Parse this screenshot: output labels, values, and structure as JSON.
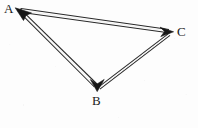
{
  "figure": {
    "name": "triangle-vector-diagram",
    "type": "geometry-diagram",
    "background_color": "#fdfdfd",
    "stroke_color": "#2a2a2a",
    "label_color": "#1a1a1a",
    "width": 198,
    "height": 128
  },
  "labels": {
    "a": "A",
    "b": "B",
    "c": "C"
  },
  "vertices": [
    {
      "id": "A",
      "label": "A",
      "x": 16,
      "y": 9,
      "label_x": 4,
      "label_y": 2
    },
    {
      "id": "B",
      "label": "B",
      "x": 97,
      "y": 90,
      "label_x": 92,
      "label_y": 94
    },
    {
      "id": "C",
      "label": "C",
      "x": 172,
      "y": 32,
      "label_x": 177,
      "label_y": 25
    }
  ],
  "edges": [
    {
      "id": "edge-CA",
      "from": "C",
      "to": "A",
      "style": "double-line",
      "arrowhead_at": "A",
      "arrow_direction": "up-left"
    },
    {
      "id": "edge-AB",
      "from": "A",
      "to": "B",
      "style": "double-line",
      "arrowhead_at": "B",
      "arrow_direction": "down"
    },
    {
      "id": "edge-BC",
      "from": "B",
      "to": "C",
      "style": "double-line",
      "arrowhead_at": "C",
      "arrow_direction": "right"
    }
  ],
  "arrowheads": [
    {
      "id": "arrowhead-A",
      "at_vertex": "A",
      "tip_x": 16,
      "tip_y": 9,
      "fill": "#1a1a1a"
    },
    {
      "id": "arrowhead-B",
      "at_vertex": "B",
      "tip_x": 97,
      "tip_y": 90,
      "fill": "#1a1a1a"
    },
    {
      "id": "arrowhead-C",
      "at_vertex": "C",
      "tip_x": 172,
      "tip_y": 32,
      "fill": "#1a1a1a"
    }
  ]
}
